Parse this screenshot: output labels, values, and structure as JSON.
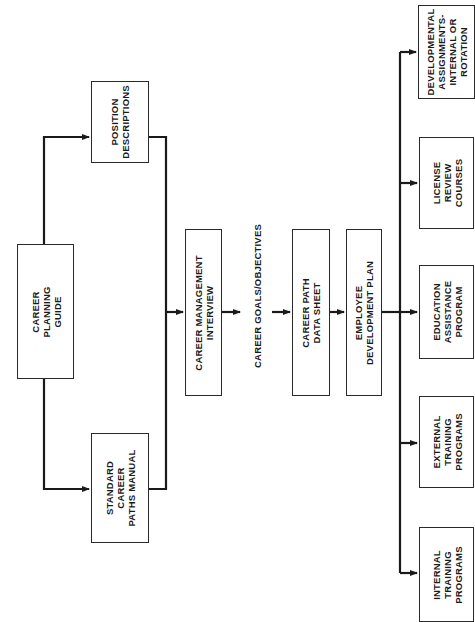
{
  "diagram": {
    "orientation": "rotated 90 degrees counter-clockwise",
    "nodes": {
      "career_planning_guide": "CAREER\nPLANNING\nGUIDE",
      "position_descriptions": "POSITION\nDESCRIPTIONS",
      "standard_career_paths_manual": "STANDARD\nCAREER\nPATHS MANUAL",
      "career_management_interview": "CAREER MANAGEMENT\nINTERVIEW",
      "career_goals_objectives": "CAREER GOALS/OBJECTIVES",
      "career_path_data_sheet": "CAREER PATH\nDATA SHEET",
      "employee_development_plan": "EMPLOYEE\nDEVELOPMENT PLAN",
      "developmental_assignments": "DEVELOPMENTAL\nASSIGNMENTS-\nINTERNAL OR\nROTATION",
      "license_review_courses": "LICENSE\nREVIEW\nCOURSES",
      "education_assistance_program": "EDUCATION\nASSISTANCE\nPROGRAM",
      "external_training_programs": "EXTERNAL\nTRAINING\nPROGRAMS",
      "internal_training_programs": "INTERNAL\nTRAINING\nPROGRAMS"
    },
    "edges": [
      [
        "career_planning_guide",
        "position_descriptions"
      ],
      [
        "career_planning_guide",
        "standard_career_paths_manual"
      ],
      [
        "position_descriptions",
        "career_management_interview"
      ],
      [
        "standard_career_paths_manual",
        "career_management_interview"
      ],
      [
        "career_management_interview",
        "career_goals_objectives"
      ],
      [
        "career_goals_objectives",
        "career_path_data_sheet"
      ],
      [
        "career_path_data_sheet",
        "employee_development_plan"
      ],
      [
        "employee_development_plan",
        "developmental_assignments"
      ],
      [
        "employee_development_plan",
        "license_review_courses"
      ],
      [
        "employee_development_plan",
        "education_assistance_program"
      ],
      [
        "employee_development_plan",
        "external_training_programs"
      ],
      [
        "employee_development_plan",
        "internal_training_programs"
      ]
    ],
    "colors": {
      "line": "#1a1a1a",
      "box_border": "#2a2a2a",
      "background": "#ffffff"
    }
  }
}
